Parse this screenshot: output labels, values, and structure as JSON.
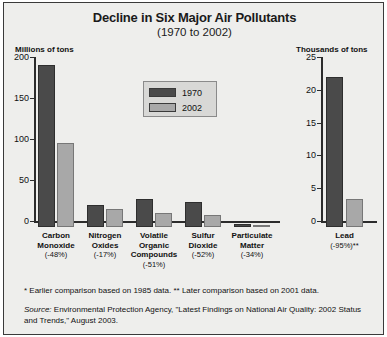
{
  "figure": {
    "title": "Decline in Six Major Air Pollutants",
    "subtitle": "(1970 to 2002)",
    "unit_left": "Millions of tons",
    "unit_right": "Thousands of tons"
  },
  "legend": {
    "entries": [
      {
        "label": "1970",
        "color": "#4a4a4a"
      },
      {
        "label": "2002",
        "color": "#a8a8a8"
      }
    ]
  },
  "footnotes": {
    "stars": "* Earlier comparison based on 1985 data.  ** Later comparison based on 2001 data.",
    "source_label": "Source:",
    "source_text": " Environmental Protection  Agency, \"Latest Findings on National Air Quality: 2002 Status and Trends,\" August 2003."
  },
  "chart_data": {
    "type": "bar",
    "title": "Decline in Six Major Air Pollutants",
    "subtitle": "(1970 to 2002)",
    "xlabel": "",
    "legend_position": "inside-upper-center",
    "grid": false,
    "panels": [
      {
        "name": "main",
        "ylabel": "Millions of tons",
        "ylim": [
          0,
          200
        ],
        "yticks": [
          0,
          50,
          100,
          150,
          200
        ],
        "ytick_labels": [
          "0",
          "50",
          "100",
          "150",
          "200"
        ],
        "categories": [
          "Carbon Monoxide",
          "Nitrogen Oxides",
          "Volatile Organic Compounds",
          "Sulfur Dioxide",
          "Particulate Matter"
        ],
        "category_lines": [
          [
            "Carbon",
            "Monoxide"
          ],
          [
            "Nitrogen",
            "Oxides"
          ],
          [
            "Volatile",
            "Organic",
            "Compounds"
          ],
          [
            "Sulfur",
            "Dioxide"
          ],
          [
            "Particulate",
            "Matter"
          ]
        ],
        "category_changes": [
          "(-48%)",
          "(-17%)",
          "(-51%)",
          "(-52%)",
          "(-34%)"
        ],
        "series": [
          {
            "name": "1970",
            "color": "#4a4a4a",
            "values": [
              197,
              27,
              34,
              31,
              4
            ]
          },
          {
            "name": "2002",
            "color": "#a8a8a8",
            "values": [
              102,
              22,
              17,
              15,
              2.6
            ]
          }
        ]
      },
      {
        "name": "lead",
        "ylabel": "Thousands of tons",
        "ylim": [
          0,
          25
        ],
        "yticks": [
          0,
          5,
          10,
          15,
          20,
          25
        ],
        "ytick_labels": [
          "0",
          "5",
          "10",
          "15",
          "20",
          "25"
        ],
        "categories": [
          "Lead"
        ],
        "category_lines": [
          [
            "Lead"
          ]
        ],
        "category_changes": [
          "(-95%)**"
        ],
        "series": [
          {
            "name": "1970",
            "color": "#4a4a4a",
            "values": [
              22.9
            ]
          },
          {
            "name": "2002",
            "color": "#a8a8a8",
            "values": [
              4.3
            ]
          }
        ]
      }
    ]
  }
}
